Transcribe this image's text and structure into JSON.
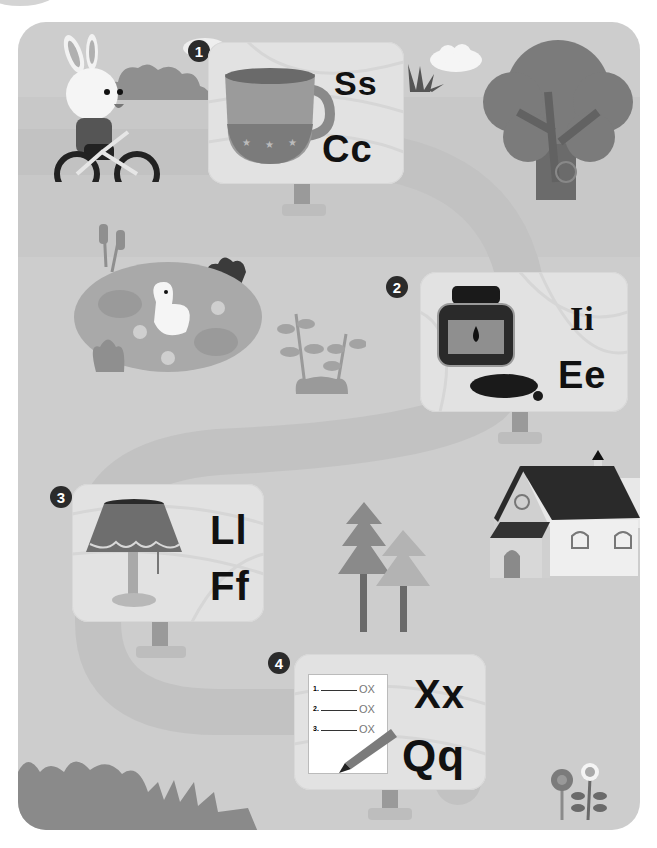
{
  "scene": {
    "title": "Letter sound path worksheet",
    "colors": {
      "background": "#ffffff",
      "frame": "#cdcdcd",
      "path": "#c2c2c2",
      "card": "#e2e2e2",
      "letters": "#111111",
      "badge": "#2b2b2b"
    }
  },
  "stations": [
    {
      "number": "1",
      "picture": "cup",
      "letters": [
        "Ss",
        "Cc"
      ]
    },
    {
      "number": "2",
      "picture": "ink",
      "letters": [
        "Ii",
        "Ee"
      ]
    },
    {
      "number": "3",
      "picture": "lamp",
      "letters": [
        "Ll",
        "Ff"
      ]
    },
    {
      "number": "4",
      "picture": "quiz",
      "letters": [
        "Xx",
        "Qq"
      ]
    }
  ],
  "quiz_sheet": {
    "lines": [
      "1.",
      "2.",
      "3."
    ],
    "marks": [
      "OX",
      "OX",
      "OX"
    ]
  },
  "decorations": [
    "rabbit-on-bicycle",
    "bushes",
    "cloud",
    "grass-tuft",
    "tree",
    "pond-with-ducks",
    "cattails",
    "sprout-plant",
    "pine-trees",
    "house",
    "flowers"
  ]
}
